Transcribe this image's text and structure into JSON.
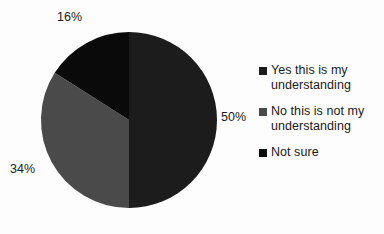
{
  "chart_data": {
    "type": "pie",
    "title": "",
    "categories": [
      "Yes this is my understanding",
      "No this is not my understanding",
      "Not sure"
    ],
    "values": [
      50,
      34,
      16
    ],
    "labels": [
      "50%",
      "34%",
      "16%"
    ],
    "colors": [
      "#1c1c1c",
      "#4a4a4a",
      "#0a0a0a"
    ],
    "legend_position": "right",
    "grid": false,
    "start_angle_deg": 0,
    "direction": "clockwise",
    "background": "#fdfdfd",
    "slices": [
      {
        "name": "Yes this is my understanding",
        "value": 50,
        "label": "50%",
        "color": "#1c1c1c",
        "start_deg": 0,
        "end_deg": 180
      },
      {
        "name": "No this is not my understanding",
        "value": 34,
        "label": "34%",
        "color": "#4a4a4a",
        "start_deg": 180,
        "end_deg": 302.4
      },
      {
        "name": "Not sure",
        "value": 16,
        "label": "16%",
        "color": "#0a0a0a",
        "start_deg": 302.4,
        "end_deg": 360
      }
    ],
    "xlabel": "",
    "ylabel": ""
  },
  "legend": {
    "items": [
      {
        "label": "Yes this is my understanding",
        "color": "#1c1c1c"
      },
      {
        "label": "No this is not my understanding",
        "color": "#4a4a4a"
      },
      {
        "label": "Not sure",
        "color": "#0a0a0a"
      }
    ]
  },
  "data_labels": {
    "yes": "50%",
    "no": "34%",
    "not_sure": "16%"
  }
}
